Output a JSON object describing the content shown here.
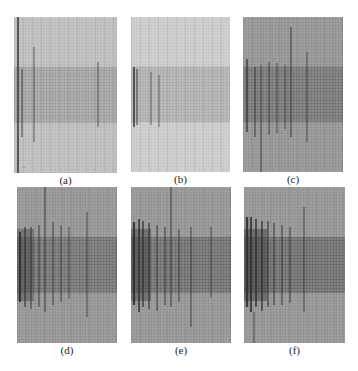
{
  "figure": {
    "panels": [
      {
        "id": "a",
        "label": "(a)",
        "x": 14,
        "y": 17,
        "w": 103,
        "h": 156,
        "bg": "#b8b8b8",
        "band": "#9a9a9a",
        "grid": "#e8e8e8",
        "stage": 0,
        "cracks": [
          {
            "x": 4,
            "y1": 0,
            "y2": 156,
            "w": 1.6
          },
          {
            "x": 8,
            "y1": 52,
            "y2": 120,
            "w": 1
          },
          {
            "x": 20,
            "y1": 30,
            "y2": 125,
            "w": 0.8
          },
          {
            "x": 84,
            "y1": 45,
            "y2": 110,
            "w": 0.8
          },
          {
            "x": 10,
            "y1": 150,
            "y2": 151,
            "w": 0.6
          }
        ]
      },
      {
        "id": "b",
        "label": "(b)",
        "x": 131,
        "y": 17,
        "w": 99,
        "h": 155,
        "bg": "#c6c6c6",
        "band": "#a8a8a8",
        "grid": "#ececec",
        "stage": 1,
        "cracks": [
          {
            "x": 3,
            "y1": 50,
            "y2": 110,
            "w": 1.6
          },
          {
            "x": 6,
            "y1": 52,
            "y2": 108,
            "w": 1
          },
          {
            "x": 20,
            "y1": 55,
            "y2": 108,
            "w": 0.7
          },
          {
            "x": 28,
            "y1": 58,
            "y2": 110,
            "w": 0.7
          }
        ]
      },
      {
        "id": "c",
        "label": "(c)",
        "x": 243,
        "y": 17,
        "w": 100,
        "h": 155,
        "bg": "#8e8e8e",
        "band": "#6e6e6e",
        "grid": "#cfcfcf",
        "stage": 2,
        "cracks": [
          {
            "x": 4,
            "y1": 42,
            "y2": 115,
            "w": 1.4
          },
          {
            "x": 12,
            "y1": 50,
            "y2": 120,
            "w": 1
          },
          {
            "x": 18,
            "y1": 48,
            "y2": 155,
            "w": 0.9
          },
          {
            "x": 26,
            "y1": 45,
            "y2": 118,
            "w": 0.9
          },
          {
            "x": 34,
            "y1": 46,
            "y2": 116,
            "w": 0.8
          },
          {
            "x": 42,
            "y1": 48,
            "y2": 112,
            "w": 0.8
          },
          {
            "x": 48,
            "y1": 10,
            "y2": 120,
            "w": 1
          },
          {
            "x": 64,
            "y1": 35,
            "y2": 125,
            "w": 0.8
          }
        ]
      },
      {
        "id": "d",
        "label": "(d)",
        "x": 17,
        "y": 187,
        "w": 100,
        "h": 156,
        "bg": "#8e8e8e",
        "band": "#6a6a6a",
        "grid": "#cfcfcf",
        "stage": 3,
        "cracks": [
          {
            "x": 3,
            "y1": 45,
            "y2": 115,
            "w": 2
          },
          {
            "x": 8,
            "y1": 40,
            "y2": 120,
            "w": 1.2
          },
          {
            "x": 14,
            "y1": 40,
            "y2": 122,
            "w": 1
          },
          {
            "x": 22,
            "y1": 38,
            "y2": 120,
            "w": 1
          },
          {
            "x": 28,
            "y1": 0,
            "y2": 125,
            "w": 1
          },
          {
            "x": 36,
            "y1": 35,
            "y2": 118,
            "w": 0.9
          },
          {
            "x": 44,
            "y1": 38,
            "y2": 115,
            "w": 0.9
          },
          {
            "x": 52,
            "y1": 40,
            "y2": 112,
            "w": 0.8
          },
          {
            "x": 70,
            "y1": 25,
            "y2": 130,
            "w": 0.8
          }
        ]
      },
      {
        "id": "e",
        "label": "(e)",
        "x": 131,
        "y": 187,
        "w": 100,
        "h": 156,
        "bg": "#8e8e8e",
        "band": "#666666",
        "grid": "#cfcfcf",
        "stage": 4,
        "cracks": [
          {
            "x": 3,
            "y1": 35,
            "y2": 118,
            "w": 2.2
          },
          {
            "x": 8,
            "y1": 32,
            "y2": 125,
            "w": 1.6
          },
          {
            "x": 12,
            "y1": 34,
            "y2": 120,
            "w": 1.4
          },
          {
            "x": 18,
            "y1": 36,
            "y2": 122,
            "w": 1.2
          },
          {
            "x": 26,
            "y1": 38,
            "y2": 124,
            "w": 1
          },
          {
            "x": 34,
            "y1": 40,
            "y2": 118,
            "w": 1
          },
          {
            "x": 40,
            "y1": 0,
            "y2": 120,
            "w": 1
          },
          {
            "x": 48,
            "y1": 42,
            "y2": 115,
            "w": 0.9
          },
          {
            "x": 60,
            "y1": 40,
            "y2": 140,
            "w": 0.9
          },
          {
            "x": 80,
            "y1": 40,
            "y2": 110,
            "w": 0.8
          }
        ]
      },
      {
        "id": "f",
        "label": "(f)",
        "x": 244,
        "y": 187,
        "w": 101,
        "h": 156,
        "bg": "#8e8e8e",
        "band": "#636363",
        "grid": "#cfcfcf",
        "stage": 5,
        "cracks": [
          {
            "x": 3,
            "y1": 30,
            "y2": 120,
            "w": 2.4
          },
          {
            "x": 7,
            "y1": 30,
            "y2": 125,
            "w": 1.8
          },
          {
            "x": 12,
            "y1": 32,
            "y2": 120,
            "w": 1.6
          },
          {
            "x": 18,
            "y1": 34,
            "y2": 124,
            "w": 1.4
          },
          {
            "x": 24,
            "y1": 34,
            "y2": 120,
            "w": 1.2
          },
          {
            "x": 30,
            "y1": 36,
            "y2": 118,
            "w": 1.1
          },
          {
            "x": 38,
            "y1": 38,
            "y2": 118,
            "w": 1
          },
          {
            "x": 46,
            "y1": 40,
            "y2": 116,
            "w": 1
          },
          {
            "x": 60,
            "y1": 20,
            "y2": 125,
            "w": 0.9
          },
          {
            "x": 10,
            "y1": 125,
            "y2": 156,
            "w": 0.8
          }
        ]
      }
    ],
    "band_top_ratio": 0.32,
    "band_bottom_ratio": 0.68
  }
}
